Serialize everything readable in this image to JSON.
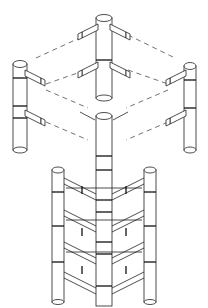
{
  "figure": {
    "title": "",
    "colors": {
      "line": "#222222",
      "background": "#ffffff"
    },
    "parts": [
      {
        "name": "top-center-column-unit"
      },
      {
        "name": "left-column-unit"
      },
      {
        "name": "right-column-unit"
      },
      {
        "name": "front-center-column-unit"
      },
      {
        "name": "assembled-tower"
      }
    ]
  }
}
